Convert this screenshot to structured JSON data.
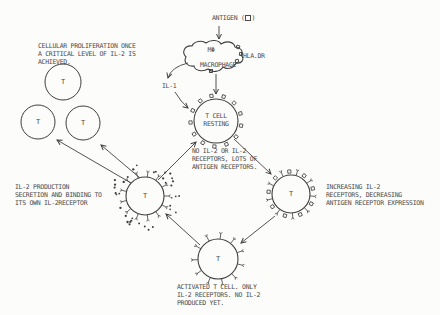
{
  "colors": {
    "ink": "#3f3f3f",
    "text": "#4a4a4a",
    "paper": "#fcfcfa"
  },
  "antigen": {
    "prefix": "ANTIGEN (",
    "suffix": ")",
    "symbol_icon": "small-square-icon"
  },
  "macrophage": {
    "symbol": "MΦ",
    "label": "MACROPHAGE",
    "hla_label": "HLA.DR"
  },
  "il1": {
    "label": "IL-1"
  },
  "resting_cell": {
    "label": "T CELL\nRESTING",
    "caption": "NO IL-2 OR IL-2\nRECEPTORS, LOTS OF\nANTIGEN RECEPTORS."
  },
  "proliferation": {
    "caption": "CELLULAR PROLIFERATION ONCE\nA CRITICAL LEVEL OF IL-2 IS\nACHIEVED.",
    "cell_labels": [
      "T",
      "T",
      "T"
    ]
  },
  "production_cell": {
    "label": "T",
    "caption": "IL-2 PRODUCTION\nSECRETION AND BINDING TO\nITS OWN IL-2RECEPTOR"
  },
  "increasing_cell": {
    "label": "T",
    "caption": "INCREASING IL-2\nRECEPTORS, DECREASING\nANTIGEN RECEPTOR EXPRESSION"
  },
  "activated_cell": {
    "label": "T",
    "caption": "ACTIVATED T CELL. ONLY\nIL-2 RECEPTORS. NO IL-2\nPRODUCED YET."
  }
}
